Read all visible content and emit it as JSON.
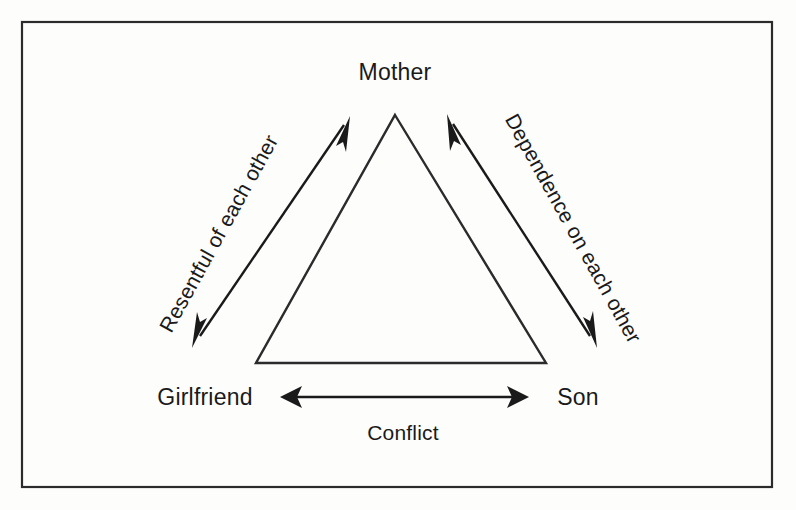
{
  "diagram": {
    "background_color": "#fdfdfc",
    "line_color": "#1a1a1a",
    "frame": {
      "name": "outer-border",
      "x": 22,
      "y": 22,
      "width": 750,
      "height": 465
    },
    "nodes": [
      {
        "id": "mother",
        "label": "Mother",
        "x": 395,
        "y": 80,
        "anchor": "middle"
      },
      {
        "id": "girlfriend",
        "label": "Girlfriend",
        "x": 205,
        "y": 405,
        "anchor": "middle"
      },
      {
        "id": "son",
        "label": "Son",
        "x": 578,
        "y": 405,
        "anchor": "middle"
      }
    ],
    "triangle": {
      "name": "central-triangle",
      "apex": {
        "x": 395,
        "y": 115
      },
      "base_left": {
        "x": 256,
        "y": 363
      },
      "base_right": {
        "x": 546,
        "y": 363
      }
    },
    "edges": [
      {
        "id": "mother-girlfriend",
        "label": "Resentful of each other",
        "from": "Mother",
        "to": "Girlfriend",
        "double_headed": true,
        "label_x": 225,
        "label_y": 237,
        "label_rotation": -61,
        "line": {
          "x1": 350,
          "y1": 117,
          "x2": 192,
          "y2": 347
        }
      },
      {
        "id": "mother-son",
        "label": "Dependence on each other",
        "from": "Mother",
        "to": "Son",
        "double_headed": true,
        "label_x": 567,
        "label_y": 232,
        "label_rotation": 61,
        "line": {
          "x1": 447,
          "y1": 115,
          "x2": 597,
          "y2": 347
        }
      },
      {
        "id": "girlfriend-son",
        "label": "Conflict",
        "from": "Girlfriend",
        "to": "Son",
        "double_headed": true,
        "label_x": 403,
        "label_y": 440,
        "label_rotation": 0,
        "line": {
          "x1": 281,
          "y1": 397,
          "x2": 528,
          "y2": 397
        }
      }
    ]
  }
}
